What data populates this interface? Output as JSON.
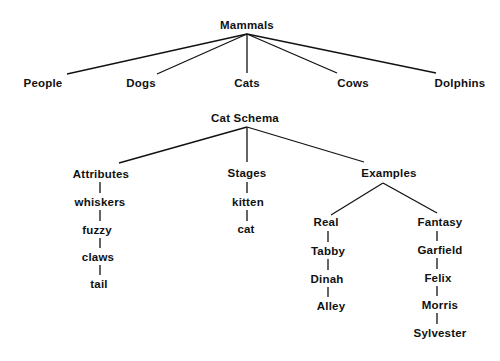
{
  "diagrams": {
    "mammals": {
      "root": "Mammals",
      "children": [
        "People",
        "Dogs",
        "Cats",
        "Cows",
        "Dolphins"
      ]
    },
    "cat_schema": {
      "root": "Cat Schema",
      "attributes": {
        "label": "Attributes",
        "items": [
          "whiskers",
          "fuzzy",
          "claws",
          "tail"
        ]
      },
      "stages": {
        "label": "Stages",
        "items": [
          "kitten",
          "cat"
        ]
      },
      "examples": {
        "label": "Examples",
        "real": {
          "label": "Real",
          "items": [
            "Tabby",
            "Dinah",
            "Alley"
          ]
        },
        "fantasy": {
          "label": "Fantasy",
          "items": [
            "Garfield",
            "Felix",
            "Morris",
            "Sylvester"
          ]
        }
      }
    }
  },
  "colors": {
    "ink": "#111111",
    "background": "#ffffff"
  }
}
